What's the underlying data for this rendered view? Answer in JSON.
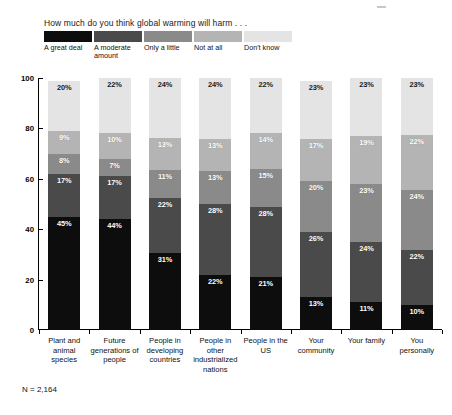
{
  "chart_data": {
    "type": "bar",
    "subtype": "stacked-percent-vertical",
    "title": "How much do you think global warming will harm . . .",
    "xlabel": "",
    "ylabel": "",
    "ylim": [
      0,
      100
    ],
    "yticks": [
      0,
      20,
      40,
      60,
      80,
      100
    ],
    "ytick_labels": [
      "0",
      "20",
      "40",
      "60",
      "80",
      "100"
    ],
    "grid": false,
    "legend_position": "top-left",
    "stack_order_bottom_to_top": [
      "A great deal",
      "A moderate amount",
      "Only a little",
      "Not at all",
      "Don't know"
    ],
    "categories": [
      "Plant and animal species",
      "Future generations of people",
      "People in developing countries",
      "People in other industrialized nations",
      "People in the US",
      "Your community",
      "Your family",
      "You personally"
    ],
    "series": [
      {
        "name": "A great deal",
        "color": "#0d0d0d",
        "values": [
          45,
          44,
          31,
          22,
          21,
          13,
          11,
          10
        ]
      },
      {
        "name": "A moderate amount",
        "color": "#4a4a4a",
        "values": [
          17,
          17,
          22,
          28,
          28,
          26,
          24,
          22
        ]
      },
      {
        "name": "Only a little",
        "color": "#8a8a8a",
        "values": [
          8,
          7,
          11,
          13,
          15,
          20,
          23,
          24
        ]
      },
      {
        "name": "Not at all",
        "color": "#b4b4b4",
        "values": [
          9,
          10,
          13,
          13,
          14,
          17,
          19,
          22
        ]
      },
      {
        "name": "Don't know",
        "color": "#e4e4e4",
        "values": [
          20,
          22,
          24,
          24,
          22,
          23,
          23,
          23
        ]
      }
    ],
    "annotations": [
      "N = 2,164"
    ]
  },
  "legend": {
    "title": "How much do you think global warming will harm . . .",
    "items": [
      {
        "label": "A great deal",
        "color": "#0d0d0d"
      },
      {
        "label": "A moderate amount",
        "color": "#4a4a4a"
      },
      {
        "label": "Only a little",
        "color": "#8a8a8a"
      },
      {
        "label": "Not at all",
        "color": "#b4b4b4"
      },
      {
        "label": "Don't know",
        "color": "#e4e4e4"
      }
    ]
  },
  "footnote": "N = 2,164"
}
